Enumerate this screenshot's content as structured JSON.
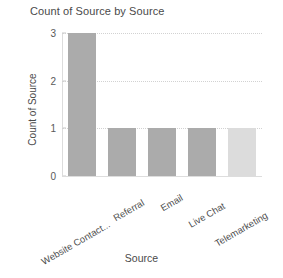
{
  "chart_data": {
    "type": "bar",
    "title": "Count of Source by Source",
    "xlabel": "Source",
    "ylabel": "Count of Source",
    "categories": [
      "Website Contact...",
      "Referral",
      "Email",
      "Live Chat",
      "Telemarketing"
    ],
    "values": [
      3,
      1,
      1,
      1,
      1
    ],
    "ylim": [
      0,
      3
    ],
    "yticks": [
      "0",
      "1",
      "2",
      "3"
    ],
    "ytick_values": [
      0,
      1,
      2,
      3
    ],
    "grid": true,
    "grid_axis": "y",
    "legend": false,
    "bar_colors": [
      "#ababab",
      "#ababab",
      "#ababab",
      "#ababab",
      "#dcdcdc"
    ]
  },
  "colors": {
    "background": "#ffffff",
    "bar_default": "#ababab",
    "bar_highlight": "#dcdcdc",
    "gridline": "#d2d2d2",
    "axis": "#dddddd",
    "title_text": "#4a4a4a",
    "tick_text": "#595959"
  }
}
